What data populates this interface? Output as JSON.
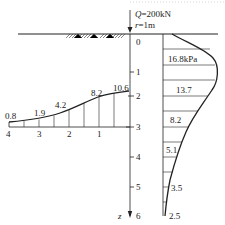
{
  "load": {
    "q_label": "Q",
    "q_value": "=200kN",
    "r_label": "r",
    "r_value": "=1m"
  },
  "axis": {
    "z_label": "z",
    "depth_ticks": [
      "0",
      "1",
      "2",
      "3",
      "4",
      "5",
      "6"
    ]
  },
  "vertical_distribution": {
    "values": [
      "16.8kPa",
      "13.7",
      "8.2",
      "5.1",
      "3.5",
      "2.5"
    ]
  },
  "horizontal_distribution": {
    "values": [
      "0.8",
      "1.9",
      "4.2",
      "8.2",
      "10.6"
    ],
    "distance_ticks": [
      "4",
      "3",
      "2",
      "1"
    ]
  },
  "colors": {
    "line": "#222222",
    "border_dots": "#d8d8d8"
  }
}
